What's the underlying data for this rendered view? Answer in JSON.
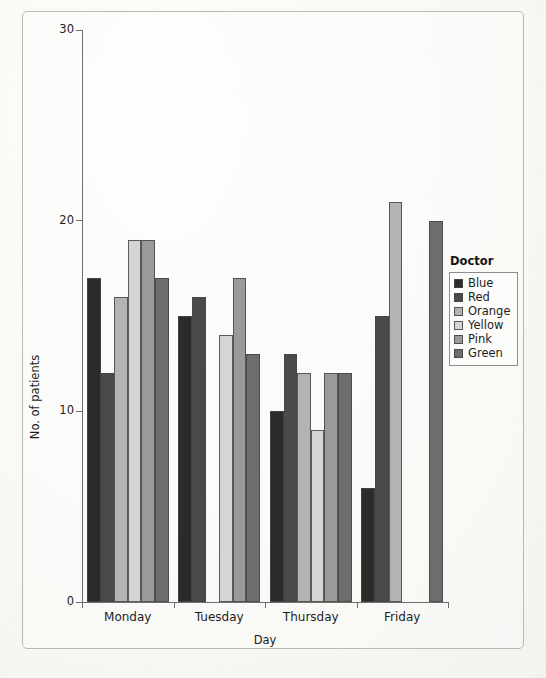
{
  "figure": {
    "background_color": "#f7f7f4",
    "frame_color": "#b9b9b4",
    "axis_color": "#6e6e6e",
    "text_color": "#1d1d1d"
  },
  "legend": {
    "title": "Doctor",
    "position": "right",
    "entries": [
      {
        "label": "Blue",
        "color": "#2b2b2b"
      },
      {
        "label": "Red",
        "color": "#4a4a4a"
      },
      {
        "label": "Orange",
        "color": "#b3b3b3"
      },
      {
        "label": "Yellow",
        "color": "#d5d5d5"
      },
      {
        "label": "Pink",
        "color": "#9a9a9a"
      },
      {
        "label": "Green",
        "color": "#6d6d6d"
      }
    ]
  },
  "chart_data": {
    "type": "bar",
    "title": "",
    "subtitle": "",
    "xlabel": "Day",
    "ylabel": "No. of patients",
    "categories": [
      "Monday",
      "Tuesday",
      "Thursday",
      "Friday"
    ],
    "ylim": [
      0,
      30
    ],
    "yticks": [
      0,
      10,
      20,
      30
    ],
    "ytick_labels": [
      "0",
      "10",
      "20",
      "30"
    ],
    "grid": false,
    "legend_title": "Doctor",
    "legend_position": "right",
    "series": [
      {
        "name": "Blue",
        "color": "#2b2b2b",
        "values": [
          17,
          15,
          10,
          6
        ]
      },
      {
        "name": "Red",
        "color": "#4a4a4a",
        "values": [
          12,
          16,
          13,
          15
        ]
      },
      {
        "name": "Orange",
        "color": "#b3b3b3",
        "values": [
          16,
          0,
          12,
          21
        ]
      },
      {
        "name": "Yellow",
        "color": "#d5d5d5",
        "values": [
          19,
          14,
          9,
          0
        ]
      },
      {
        "name": "Pink",
        "color": "#9a9a9a",
        "values": [
          19,
          17,
          12,
          0
        ]
      },
      {
        "name": "Green",
        "color": "#6d6d6d",
        "values": [
          17,
          13,
          12,
          20
        ]
      }
    ]
  }
}
